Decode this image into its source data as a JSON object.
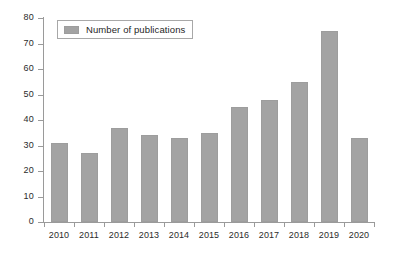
{
  "chart_data": {
    "type": "bar",
    "title": "",
    "xlabel": "",
    "ylabel": "",
    "categories": [
      "2010",
      "2011",
      "2012",
      "2013",
      "2014",
      "2015",
      "2016",
      "2017",
      "2018",
      "2019",
      "2020"
    ],
    "values": [
      31,
      27,
      37,
      34,
      33,
      35,
      45,
      48,
      55,
      75,
      33
    ],
    "series": [
      {
        "name": "Number of publications",
        "values": [
          31,
          27,
          37,
          34,
          33,
          35,
          45,
          48,
          55,
          75,
          33
        ]
      }
    ],
    "ylim": [
      0,
      80
    ],
    "yticks": [
      0,
      10,
      20,
      30,
      40,
      50,
      60,
      70,
      80
    ],
    "ytick_labels": [
      "0",
      "10",
      "20",
      "30",
      "40",
      "50",
      "60",
      "70",
      "80"
    ],
    "grid": false,
    "legend": {
      "position": "top-left",
      "entries": [
        {
          "label": "Number of publications",
          "color": "#a3a3a3"
        }
      ]
    },
    "colors": {
      "bar_fill": "#a3a3a3",
      "bar_border": "#9d9d9d",
      "axis": "#9a9a9a",
      "text": "#2b2b2b",
      "background": "#ffffff",
      "legend_border": "#a8a8a8"
    }
  }
}
